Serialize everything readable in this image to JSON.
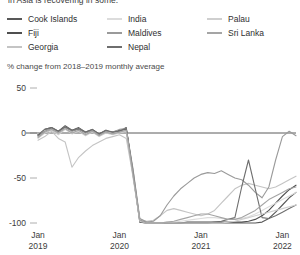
{
  "header": {
    "clipped_title": "in Asia is recovering in some."
  },
  "subtitle": "% change from 2018–2019  monthly average",
  "legend": {
    "columns": [
      {
        "items": [
          {
            "label": "Cook Islands",
            "color": "#585858"
          },
          {
            "label": "Fiji",
            "color": "#4f4f4f"
          },
          {
            "label": "Georgia",
            "color": "#c4c4c4"
          }
        ]
      },
      {
        "items": [
          {
            "label": "India",
            "color": "#dcdcdc"
          },
          {
            "label": "Maldives",
            "color": "#9a9a9a"
          },
          {
            "label": "Nepal",
            "color": "#6e6e6e"
          }
        ]
      },
      {
        "items": [
          {
            "label": "Palau",
            "color": "#cfcfcf"
          },
          {
            "label": "Sri Lanka",
            "color": "#a5a5a5"
          }
        ]
      }
    ]
  },
  "axes": {
    "y_ticks": [
      "50",
      "0",
      "-50",
      "-100"
    ],
    "y_values": [
      50,
      0,
      -50,
      -100
    ],
    "x_ticks": [
      {
        "month": "Jan",
        "year": "2019"
      },
      {
        "month": "Jan",
        "year": "2020"
      },
      {
        "month": "Jan",
        "year": "2021"
      },
      {
        "month": "Jan",
        "year": "2022"
      }
    ]
  },
  "chart_data": {
    "type": "line",
    "title": "in Asia is recovering in some.",
    "xlabel": "",
    "ylabel": "% change from 2018–2019  monthly average",
    "ylim": [
      -100,
      50
    ],
    "grid": false,
    "legend_position": "top",
    "x": [
      "2019-01",
      "2019-02",
      "2019-03",
      "2019-04",
      "2019-05",
      "2019-06",
      "2019-07",
      "2019-08",
      "2019-09",
      "2019-10",
      "2019-11",
      "2019-12",
      "2020-01",
      "2020-02",
      "2020-03",
      "2020-04",
      "2020-05",
      "2020-06",
      "2020-07",
      "2020-08",
      "2020-09",
      "2020-10",
      "2020-11",
      "2020-12",
      "2021-01",
      "2021-02",
      "2021-03",
      "2021-04",
      "2021-05",
      "2021-06",
      "2021-07",
      "2021-08",
      "2021-09",
      "2021-10",
      "2021-11",
      "2021-12",
      "2022-01",
      "2022-02",
      "2022-03"
    ],
    "series": [
      {
        "name": "Cook Islands",
        "color": "#585858",
        "values": [
          -3,
          4,
          6,
          2,
          8,
          3,
          6,
          1,
          4,
          -1,
          3,
          0,
          2,
          6,
          -45,
          -99,
          -100,
          -100,
          -100,
          -100,
          -100,
          -100,
          -100,
          -100,
          -100,
          -100,
          -100,
          -100,
          -100,
          -100,
          -100,
          -100,
          -100,
          -99,
          -95,
          -88,
          -80,
          -72,
          -66
        ]
      },
      {
        "name": "Fiji",
        "color": "#4f4f4f",
        "values": [
          -2,
          3,
          5,
          1,
          6,
          2,
          4,
          0,
          3,
          -2,
          2,
          1,
          3,
          4,
          -42,
          -97,
          -99,
          -100,
          -100,
          -100,
          -100,
          -100,
          -99,
          -99,
          -99,
          -99,
          -99,
          -99,
          -99,
          -99,
          -99,
          -98,
          -96,
          -92,
          -86,
          -78,
          -70,
          -63,
          -58
        ]
      },
      {
        "name": "Georgia",
        "color": "#c4c4c4",
        "values": [
          -8,
          -4,
          2,
          -6,
          -10,
          -38,
          -27,
          -20,
          -14,
          -10,
          -6,
          -4,
          -2,
          -6,
          -48,
          -96,
          -98,
          -97,
          -92,
          -86,
          -84,
          -86,
          -88,
          -90,
          -92,
          -90,
          -86,
          -78,
          -70,
          -62,
          -58,
          -56,
          -58,
          -60,
          -62,
          -60,
          -56,
          -52,
          -48
        ]
      },
      {
        "name": "India",
        "color": "#dcdcdc",
        "values": [
          -1,
          3,
          4,
          0,
          5,
          1,
          3,
          -1,
          2,
          -3,
          1,
          0,
          1,
          2,
          -44,
          -98,
          -100,
          -100,
          -100,
          -99,
          -99,
          -98,
          -97,
          -96,
          -95,
          -94,
          -94,
          -95,
          -96,
          -96,
          -95,
          -93,
          -90,
          -86,
          -82,
          -78,
          -74,
          -70,
          -66
        ]
      },
      {
        "name": "Maldives",
        "color": "#9a9a9a",
        "values": [
          -4,
          2,
          5,
          1,
          7,
          2,
          5,
          0,
          3,
          -2,
          2,
          1,
          4,
          5,
          -40,
          -95,
          -99,
          -98,
          -92,
          -80,
          -70,
          -62,
          -56,
          -50,
          -46,
          -44,
          -45,
          -42,
          -46,
          -50,
          -52,
          -58,
          -66,
          -72,
          -60,
          -30,
          -4,
          2,
          -3
        ]
      },
      {
        "name": "Nepal",
        "color": "#6e6e6e",
        "values": [
          -2,
          4,
          6,
          2,
          7,
          3,
          5,
          1,
          4,
          -1,
          3,
          1,
          2,
          5,
          -46,
          -99,
          -100,
          -100,
          -100,
          -100,
          -100,
          -100,
          -100,
          -100,
          -100,
          -100,
          -99,
          -98,
          -96,
          -94,
          -60,
          -30,
          -62,
          -94,
          -95,
          -92,
          -88,
          -84,
          -80
        ]
      },
      {
        "name": "Palau",
        "color": "#cfcfcf",
        "values": [
          -6,
          0,
          3,
          -2,
          4,
          -1,
          2,
          -3,
          1,
          -4,
          0,
          -2,
          0,
          2,
          -50,
          -98,
          -100,
          -100,
          -100,
          -100,
          -100,
          -100,
          -100,
          -100,
          -100,
          -100,
          -100,
          -100,
          -99,
          -98,
          -96,
          -94,
          -92,
          -90,
          -88,
          -86,
          -84,
          -82,
          -80
        ]
      },
      {
        "name": "Sri Lanka",
        "color": "#a5a5a5",
        "values": [
          -5,
          1,
          4,
          0,
          5,
          0,
          3,
          -2,
          2,
          -3,
          1,
          -1,
          1,
          3,
          -47,
          -97,
          -100,
          -100,
          -100,
          -99,
          -98,
          -96,
          -94,
          -92,
          -90,
          -90,
          -92,
          -94,
          -96,
          -96,
          -94,
          -90,
          -86,
          -80,
          -74,
          -70,
          -66,
          -62,
          -60
        ]
      }
    ]
  }
}
